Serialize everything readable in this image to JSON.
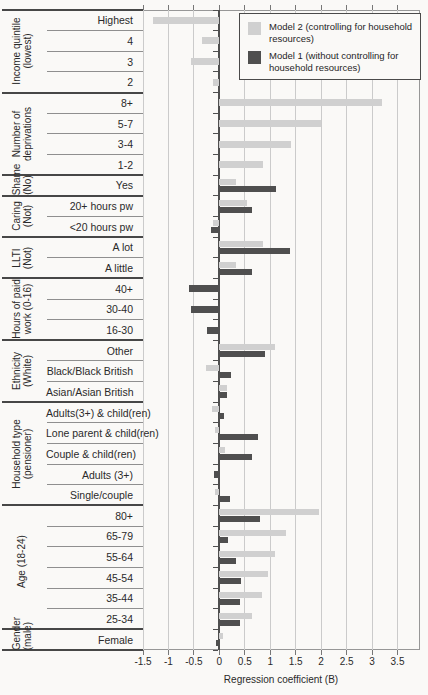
{
  "chart_data": {
    "type": "bar",
    "orientation": "horizontal",
    "title": "",
    "xlabel": "Regression coefficient (B)",
    "ylabel": "",
    "xlim": [
      -1.5,
      3.94
    ],
    "xticks": [
      -1.5,
      -1,
      -0.5,
      0,
      0.5,
      1,
      1.5,
      2,
      2.5,
      3,
      3.5
    ],
    "xtick_labels": [
      "-1.5",
      "-1",
      "-0.5",
      "0",
      "0.5",
      "1",
      "1.5",
      "2",
      "2.5",
      "3",
      "3.5"
    ],
    "grid": true,
    "legend_position": "top-right",
    "legend": [
      {
        "name": "Model 2 (controlling for household resources)",
        "color": "#d0d0d0"
      },
      {
        "name": "Model 1 (without controlling for household resources)",
        "color": "#4f4f4f"
      }
    ],
    "colors": {
      "model2_bar": "#d0d0d0",
      "model1_bar": "#4f4f4f",
      "gridline": "#cbcbcb",
      "zero_axis": "#4f4f4f",
      "frame": "#979797",
      "text": "#2a2a2a"
    },
    "groups": [
      {
        "label": "Income quintile (lowest)",
        "rows": [
          {
            "category": "Highest",
            "model2": -1.3,
            "model1": null
          },
          {
            "category": "4",
            "model2": -0.35,
            "model1": null
          },
          {
            "category": "3",
            "model2": -0.55,
            "model1": null
          },
          {
            "category": "2",
            "model2": -0.12,
            "model1": null
          }
        ]
      },
      {
        "label": "Number of deprivations",
        "rows": [
          {
            "category": "8+",
            "model2": 3.2,
            "model1": null
          },
          {
            "category": "5-7",
            "model2": 2.0,
            "model1": null
          },
          {
            "category": "3-4",
            "model2": 1.4,
            "model1": null
          },
          {
            "category": "1-2",
            "model2": 0.85,
            "model1": null
          }
        ]
      },
      {
        "label": "Shame (No)",
        "rows": [
          {
            "category": "Yes",
            "model2": 0.33,
            "model1": 1.12
          }
        ]
      },
      {
        "label": "Caring (Not)",
        "rows": [
          {
            "category": "20+ hours pw",
            "model2": 0.54,
            "model1": 0.65
          },
          {
            "category": "<20 hours pw",
            "model2": -0.12,
            "model1": -0.16
          }
        ]
      },
      {
        "label": "LLTI (Not)",
        "rows": [
          {
            "category": "A lot",
            "model2": 0.86,
            "model1": 1.38
          },
          {
            "category": "A little",
            "model2": 0.33,
            "model1": 0.64
          }
        ]
      },
      {
        "label": "Hours of paid work (0-16)",
        "rows": [
          {
            "category": "40+",
            "model2": null,
            "model1": -0.6
          },
          {
            "category": "30-40",
            "model2": null,
            "model1": -0.55
          },
          {
            "category": "16-30",
            "model2": null,
            "model1": -0.25
          }
        ]
      },
      {
        "label": "Ethnicity (White)",
        "rows": [
          {
            "category": "Other",
            "model2": 1.1,
            "model1": 0.9
          },
          {
            "category": "Black/Black British",
            "model2": -0.27,
            "model1": 0.22
          },
          {
            "category": "Asian/Asian British",
            "model2": 0.15,
            "model1": 0.15
          }
        ]
      },
      {
        "label": "Household type (pensioner)",
        "rows": [
          {
            "category": "Adults(3+) & child(ren)",
            "model2": -0.14,
            "model1": 0.1
          },
          {
            "category": "Lone parent & child(ren)",
            "model2": -0.08,
            "model1": 0.75
          },
          {
            "category": "Couple & child(ren)",
            "model2": 0.11,
            "model1": 0.65
          },
          {
            "category": "Adults (3+)",
            "model2": null,
            "model1": -0.11
          },
          {
            "category": "Single/couple",
            "model2": -0.08,
            "model1": 0.21
          }
        ]
      },
      {
        "label": "Age (18-24)",
        "rows": [
          {
            "category": "80+",
            "model2": 1.95,
            "model1": 0.8
          },
          {
            "category": "65-79",
            "model2": 1.3,
            "model1": 0.17
          },
          {
            "category": "55-64",
            "model2": 1.1,
            "model1": 0.33
          },
          {
            "category": "45-54",
            "model2": 0.95,
            "model1": 0.43
          },
          {
            "category": "35-44",
            "model2": 0.83,
            "model1": 0.4
          },
          {
            "category": "25-34",
            "model2": 0.64,
            "model1": 0.4
          }
        ]
      },
      {
        "label": "Gender (male)",
        "rows": [
          {
            "category": "Female",
            "model2": 0.08,
            "model1": -0.07
          }
        ]
      }
    ]
  }
}
